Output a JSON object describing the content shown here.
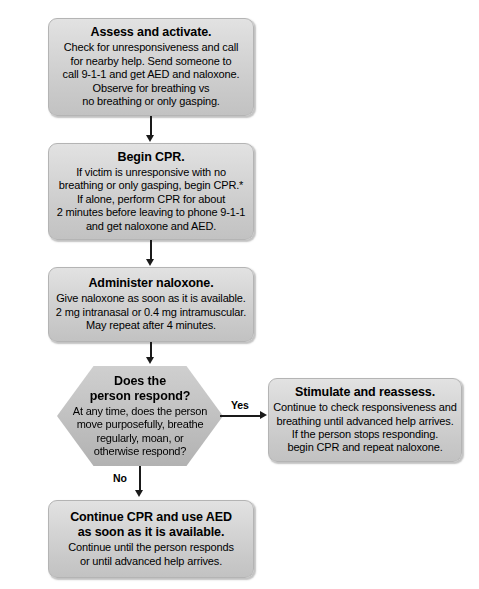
{
  "flowchart": {
    "title_hidden": "",
    "accent_colors": {
      "node_fill_top": "#e2e2e2",
      "node_fill_bottom": "#c2c2c2",
      "decision_fill_top": "#cfcfcf",
      "decision_fill_bottom": "#b2b2b2",
      "connector": "#1a1a1a",
      "text": "#000000",
      "page_background": "#ffffff"
    },
    "nodes": {
      "assess": {
        "title": "Assess and activate.",
        "lines": [
          "Check for unresponsiveness and call",
          "for nearby help. Send someone to",
          "call 9-1-1 and get AED and naloxone.",
          "Observe for breathing vs",
          "no breathing or only gasping."
        ]
      },
      "begin_cpr": {
        "title": "Begin CPR.",
        "lines": [
          "If victim is unresponsive with no",
          "breathing or only gasping, begin CPR.*",
          "If alone, perform CPR for about",
          "2 minutes before leaving to phone 9-1-1",
          "and get naloxone and AED."
        ]
      },
      "naloxone": {
        "title": "Administer naloxone.",
        "lines": [
          "Give naloxone as soon as it is available.",
          "2 mg intranasal or 0.4 mg intramuscular.",
          "May repeat after 4 minutes."
        ]
      },
      "respond": {
        "title_lines": [
          "Does the",
          "person respond?"
        ],
        "lines": [
          "At any time, does the person",
          "move purposefully, breathe",
          "regularly, moan, or",
          "otherwise respond?"
        ]
      },
      "stimulate": {
        "title": "Stimulate and reassess.",
        "lines": [
          "Continue to check responsiveness and",
          "breathing until advanced help arrives.",
          "If the person stops responding.",
          "begin CPR and repeat naloxone."
        ]
      },
      "continue_cpr": {
        "title_lines": [
          "Continue CPR and use AED",
          "as soon as it is available."
        ],
        "lines": [
          "Continue until the person responds",
          "or until advanced help arrives."
        ]
      }
    },
    "edges": {
      "yes_label": "Yes",
      "no_label": "No"
    }
  }
}
